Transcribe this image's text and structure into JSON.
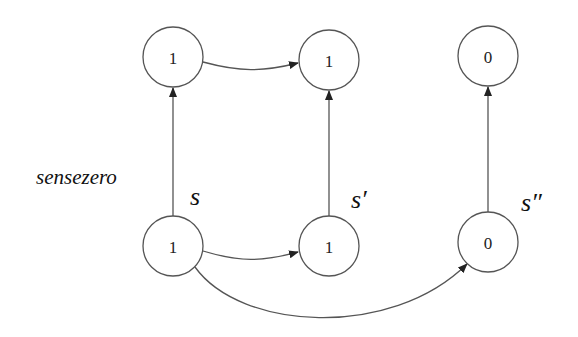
{
  "diagram": {
    "side_label": "sensezero",
    "nodes": {
      "top_left": {
        "value": "1",
        "cx": 173,
        "cy": 57
      },
      "top_middle": {
        "value": "1",
        "cx": 329,
        "cy": 60
      },
      "top_right": {
        "value": "0",
        "cx": 488,
        "cy": 56
      },
      "bottom_left": {
        "value": "1",
        "cx": 173,
        "cy": 246
      },
      "bottom_middle": {
        "value": "1",
        "cx": 329,
        "cy": 246
      },
      "bottom_right": {
        "value": "0",
        "cx": 488,
        "cy": 242
      }
    },
    "state_labels": {
      "s": "s",
      "s_prime": "s′",
      "s_double_prime": "s″"
    },
    "edges": [
      {
        "from": "bottom_left",
        "to": "top_left",
        "type": "straight"
      },
      {
        "from": "bottom_middle",
        "to": "top_middle",
        "type": "straight"
      },
      {
        "from": "bottom_right",
        "to": "top_right",
        "type": "straight"
      },
      {
        "from": "top_left",
        "to": "top_middle",
        "type": "curved"
      },
      {
        "from": "bottom_left",
        "to": "bottom_middle",
        "type": "curved"
      },
      {
        "from": "bottom_left",
        "to": "bottom_right",
        "type": "curved"
      }
    ],
    "colors": {
      "stroke": "#555555",
      "text": "#222222",
      "background": "#ffffff"
    }
  }
}
